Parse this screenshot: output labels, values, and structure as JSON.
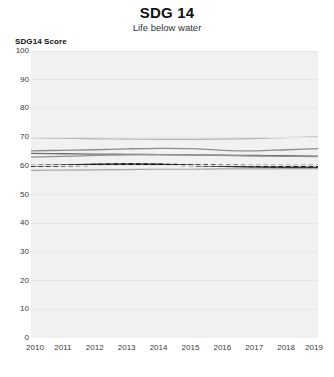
{
  "chart_data": {
    "type": "line",
    "title": "SDG 14",
    "subtitle": "Life below water",
    "ylabel": "SDG14 Score",
    "xlabel": "",
    "grid": true,
    "legend": "none",
    "ylim": [
      0,
      100
    ],
    "yticks": [
      0,
      10,
      20,
      30,
      40,
      50,
      60,
      70,
      80,
      90,
      100
    ],
    "x": [
      2010,
      2011,
      2012,
      2013,
      2014,
      2015,
      2016,
      2017,
      2018,
      2019
    ],
    "xticks": [
      "2010",
      "2011",
      "2012",
      "2013",
      "2014",
      "2015",
      "2016",
      "2017",
      "2018",
      "2019"
    ],
    "series": [
      {
        "name": "series-1",
        "style": "solid",
        "color": "#b4b4b4",
        "width": 1.2,
        "values": [
          69.8,
          69.6,
          69.4,
          69.3,
          69.2,
          69.2,
          69.3,
          69.5,
          69.8,
          70.1
        ]
      },
      {
        "name": "series-2",
        "style": "solid",
        "color": "#8c8c8c",
        "width": 1.3,
        "values": [
          65.2,
          65.4,
          65.6,
          65.9,
          66.1,
          66.0,
          65.4,
          65.2,
          65.6,
          66.0
        ]
      },
      {
        "name": "series-3",
        "style": "solid",
        "color": "#6e6e6e",
        "width": 1.3,
        "values": [
          64.3,
          64.2,
          64.1,
          64.0,
          63.9,
          63.8,
          63.7,
          63.6,
          63.5,
          63.4
        ]
      },
      {
        "name": "series-4",
        "style": "solid",
        "color": "#909090",
        "width": 1.2,
        "values": [
          63.0,
          63.3,
          63.6,
          63.8,
          63.9,
          63.8,
          63.6,
          63.4,
          63.3,
          63.2
        ]
      },
      {
        "name": "series-5",
        "style": "solid",
        "color": "#3c3c3c",
        "width": 1.5,
        "values": [
          60.0,
          60.2,
          60.5,
          60.6,
          60.5,
          60.2,
          59.8,
          59.6,
          59.5,
          59.4
        ]
      },
      {
        "name": "series-6",
        "style": "dashed",
        "color": "#1a1a1a",
        "width": 2.2,
        "values": [
          60.0,
          60.1,
          60.3,
          60.5,
          60.4,
          60.2,
          60.1,
          60.0,
          60.0,
          60.0
        ]
      },
      {
        "name": "series-7",
        "style": "solid",
        "color": "#a5a5a5",
        "width": 1.2,
        "values": [
          58.4,
          58.5,
          58.6,
          58.7,
          58.8,
          58.8,
          58.9,
          58.9,
          59.0,
          59.0
        ]
      }
    ]
  }
}
